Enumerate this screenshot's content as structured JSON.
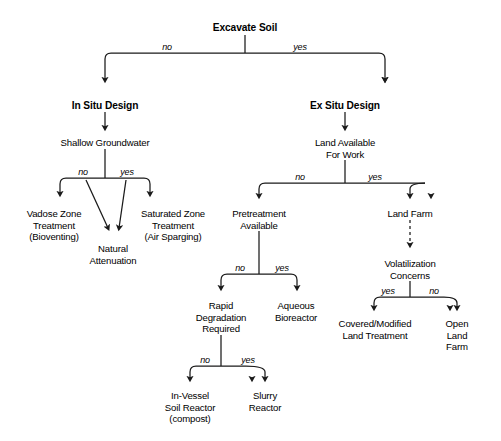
{
  "diagram": {
    "type": "decision-tree",
    "background_color": "#ffffff",
    "line_color": "#1a1a1a",
    "nodes": [
      {
        "id": "excavate-soil",
        "label": "Excavate Soil",
        "x": 245,
        "y": 22,
        "bold": true
      },
      {
        "id": "in-situ-design",
        "label": "In Situ Design",
        "x": 105,
        "y": 100,
        "bold": true
      },
      {
        "id": "ex-situ-design",
        "label": "Ex Situ Design",
        "x": 345,
        "y": 100,
        "bold": true
      },
      {
        "id": "shallow-groundwater",
        "label": "Shallow Groundwater",
        "x": 105,
        "y": 137,
        "bold": false
      },
      {
        "id": "land-available",
        "label": "Land Available\nFor Work",
        "x": 345,
        "y": 137,
        "bold": false
      },
      {
        "id": "vadose-zone",
        "label": "Vadose Zone\nTreatment\n(Bioventing)",
        "x": 54,
        "y": 208,
        "bold": false
      },
      {
        "id": "natural-attenuation",
        "label": "Natural\nAttenuation",
        "x": 113,
        "y": 243,
        "bold": false
      },
      {
        "id": "saturated-zone",
        "label": "Saturated Zone\nTreatment\n(Air Sparging)",
        "x": 173,
        "y": 208,
        "bold": false
      },
      {
        "id": "pretreatment",
        "label": "Pretreatment\nAvailable",
        "x": 259,
        "y": 208,
        "bold": false
      },
      {
        "id": "land-farm",
        "label": "Land Farm",
        "x": 410,
        "y": 208,
        "bold": false
      },
      {
        "id": "rapid-degradation",
        "label": "Rapid\nDegradation\nRequired",
        "x": 221,
        "y": 300,
        "bold": false
      },
      {
        "id": "aqueous-bioreactor",
        "label": "Aqueous\nBioreactor",
        "x": 296,
        "y": 300,
        "bold": false
      },
      {
        "id": "volatilization",
        "label": "Volatilization\nConcerns",
        "x": 410,
        "y": 258,
        "bold": false
      },
      {
        "id": "in-vessel",
        "label": "In-Vessel\nSoil Reactor\n(compost)",
        "x": 190,
        "y": 390,
        "bold": false
      },
      {
        "id": "slurry-reactor",
        "label": "Slurry\nReactor",
        "x": 265,
        "y": 390,
        "bold": false
      },
      {
        "id": "covered-modified",
        "label": "Covered/Modified\nLand Treatment",
        "x": 375,
        "y": 318,
        "bold": false
      },
      {
        "id": "open-land-farm",
        "label": "Open\nLand Farm",
        "x": 457,
        "y": 318,
        "bold": false
      }
    ],
    "edge_labels": [
      {
        "id": "excavate-no",
        "text": "no",
        "x": 167,
        "y": 42
      },
      {
        "id": "excavate-yes",
        "text": "yes",
        "x": 300,
        "y": 42
      },
      {
        "id": "groundwater-no",
        "text": "no",
        "x": 83,
        "y": 167
      },
      {
        "id": "groundwater-yes",
        "text": "yes",
        "x": 127,
        "y": 167
      },
      {
        "id": "land-avail-no",
        "text": "no",
        "x": 300,
        "y": 172
      },
      {
        "id": "land-avail-yes",
        "text": "yes",
        "x": 375,
        "y": 172
      },
      {
        "id": "pretreat-no",
        "text": "no",
        "x": 240,
        "y": 263
      },
      {
        "id": "pretreat-yes",
        "text": "yes",
        "x": 282,
        "y": 263
      },
      {
        "id": "rapid-no",
        "text": "no",
        "x": 205,
        "y": 355
      },
      {
        "id": "rapid-yes",
        "text": "yes",
        "x": 248,
        "y": 355
      },
      {
        "id": "volatil-yes",
        "text": "yes",
        "x": 388,
        "y": 286
      },
      {
        "id": "volatil-no",
        "text": "no",
        "x": 434,
        "y": 286
      }
    ],
    "decisions": [
      {
        "question": "Excavate Soil",
        "no": "In Situ Design",
        "yes": "Ex Situ Design"
      },
      {
        "question": "Shallow Groundwater",
        "no": "Vadose Zone Treatment (Bioventing) / Natural Attenuation",
        "yes": "Saturated Zone Treatment (Air Sparging) / Natural Attenuation"
      },
      {
        "question": "Land Available For Work",
        "no": "Pretreatment Available",
        "yes": "Land Farm"
      },
      {
        "question": "Pretreatment Available",
        "no": "Rapid Degradation Required",
        "yes": "Aqueous Bioreactor"
      },
      {
        "question": "Rapid Degradation Required",
        "no": "In-Vessel Soil Reactor (compost)",
        "yes": "Slurry Reactor"
      },
      {
        "question": "Volatilization Concerns",
        "yes": "Covered/Modified Land Treatment",
        "no": "Open Land Farm"
      }
    ]
  }
}
